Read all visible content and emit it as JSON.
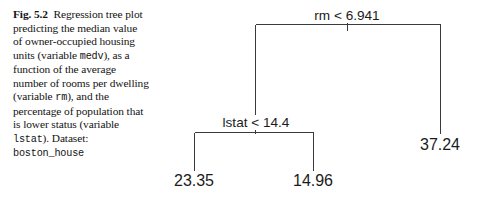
{
  "figure": {
    "caption": {
      "label": "Fig. 5.2",
      "segments": [
        {
          "text": "Regression tree plot predicting the median value of owner-occupied housing units (variable ",
          "style": "serif"
        },
        {
          "text": "medv",
          "style": "mono"
        },
        {
          "text": "), as a function of the average number of rooms per dwelling (variable ",
          "style": "serif"
        },
        {
          "text": "rm",
          "style": "mono"
        },
        {
          "text": "), and the percentage of population that is lower status (variable ",
          "style": "serif"
        },
        {
          "text": "lstat",
          "style": "mono"
        },
        {
          "text": "). Dataset: ",
          "style": "serif"
        },
        {
          "text": "boston_house",
          "style": "mono"
        }
      ],
      "plain_text": "Fig. 5.2 Regression tree plot predicting the median value of owner-occupied housing units (variable medv), as a function of the average number of rooms per dwelling (variable rm), and the percentage of population that is lower status (variable lstat). Dataset: boston_house"
    },
    "colors": {
      "background": "#ffffff",
      "line": "#3a3a3a",
      "text": "#131313",
      "node_text": "#1b1b1b"
    }
  },
  "chart_data": {
    "type": "tree",
    "target_variable": "medv",
    "predictors": [
      "rm",
      "lstat"
    ],
    "nodes": [
      {
        "id": "root",
        "kind": "split",
        "label": "rm < 6.941",
        "variable": "rm",
        "operator": "<",
        "threshold": 6.941,
        "x": 347,
        "y": 18,
        "children": [
          "internal-lstat",
          "leaf-37"
        ]
      },
      {
        "id": "internal-lstat",
        "kind": "split",
        "label": "lstat < 14.4",
        "variable": "lstat",
        "operator": "<",
        "threshold": 14.4,
        "x": 256,
        "y": 125,
        "children": [
          "leaf-23",
          "leaf-15"
        ]
      },
      {
        "id": "leaf-23",
        "kind": "leaf",
        "label": "23.35",
        "value": 23.35,
        "x": 194,
        "y": 186
      },
      {
        "id": "leaf-15",
        "kind": "leaf",
        "label": "14.96",
        "value": 14.96,
        "x": 313,
        "y": 186
      },
      {
        "id": "leaf-37",
        "kind": "leaf",
        "label": "37.24",
        "value": 37.24,
        "x": 440,
        "y": 150
      }
    ],
    "edges": [
      {
        "from": "root",
        "to": "internal-lstat",
        "branch": "true"
      },
      {
        "from": "root",
        "to": "leaf-37",
        "branch": "false"
      },
      {
        "from": "internal-lstat",
        "to": "leaf-23",
        "branch": "true"
      },
      {
        "from": "internal-lstat",
        "to": "leaf-15",
        "branch": "false"
      }
    ]
  }
}
